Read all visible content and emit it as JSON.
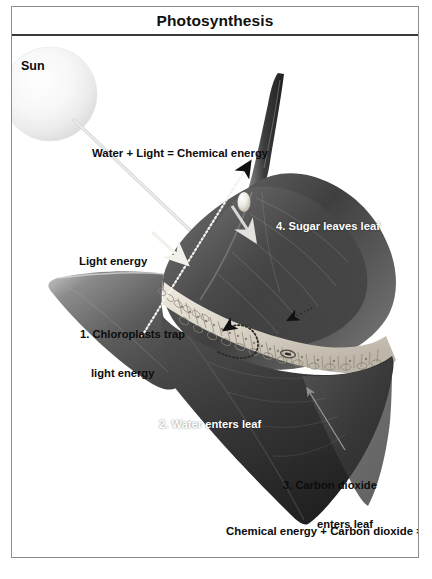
{
  "figure": {
    "title": "Photosynthesis",
    "credit": "© Infobase Learning"
  },
  "labels": {
    "sun": "Sun",
    "equation_top": "Water + Light = Chemical energy",
    "light_energy": "Light energy",
    "step1_line1": "1. Chloroplasts trap",
    "step1_line2": "light energy",
    "step2": "2. Water enters leaf",
    "step3_line1": "3. Carbon dioxide",
    "step3_line2": "enters leaf",
    "step3_line3": "through",
    "step3_line4": "stomata",
    "step4": "4. Sugar leaves leaf",
    "equation_bottom": "Chemical energy + Carbon dioxide = Sugar"
  },
  "colors": {
    "frame_border": "#8d8d8d",
    "title_rule": "#3a3a3a",
    "text_dark": "#0c0c0c",
    "text_white": "#ffffff",
    "leaf_dark": "#2b2b2b",
    "leaf_mid": "#6e6e6e",
    "leaf_light": "#d9d4cb",
    "sun_glow": "#f2f2f2",
    "arrow_gray": "#9a9a9a",
    "background": "#ffffff"
  }
}
